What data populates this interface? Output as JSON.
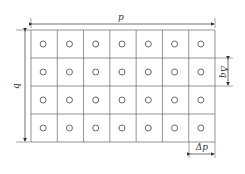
{
  "diagram": {
    "grid": {
      "rows": 4,
      "cols": 7,
      "line_color": "#666666",
      "marker": "circle"
    },
    "dimensions": {
      "width_label": "p",
      "height_label": "q",
      "cell_width_label": "Δp",
      "cell_height_label": "Δq"
    }
  }
}
